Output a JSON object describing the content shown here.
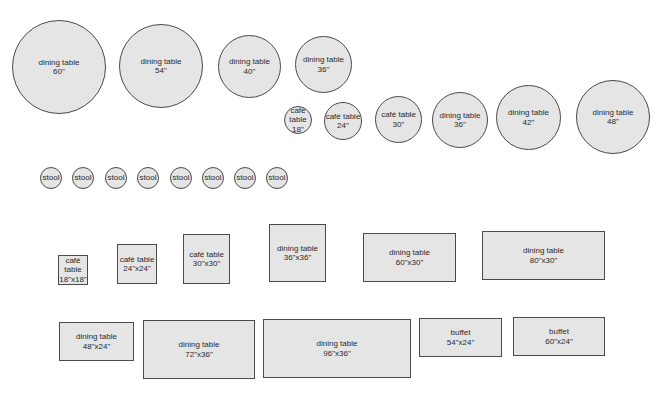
{
  "style": {
    "fill": "#e5e5e5",
    "stroke": "#4a4a4a",
    "text": "#2a2a2a",
    "background": "#ffffff"
  },
  "round_tables": [
    {
      "label": "dining table\n60\"",
      "size": "60\"",
      "x": 12,
      "y": 20,
      "d": 94
    },
    {
      "label": "dining table\n54\"",
      "size": "54\"",
      "x": 119,
      "y": 24,
      "d": 84
    },
    {
      "label": "dining table\n40\"",
      "size": "40\"",
      "x": 218,
      "y": 35,
      "d": 63
    },
    {
      "label": "dining table\n36\"",
      "size": "36\"",
      "x": 295,
      "y": 36,
      "d": 57
    },
    {
      "label": "café\ntable\n18\"",
      "size": "18\"",
      "x": 284,
      "y": 106,
      "d": 28
    },
    {
      "label": "café table\n24\"",
      "size": "24\"",
      "x": 324,
      "y": 102,
      "d": 38
    },
    {
      "label": "café table\n30\"",
      "size": "30\"",
      "x": 375,
      "y": 96,
      "d": 47
    },
    {
      "label": "dining table\n36\"",
      "size": "36\"",
      "x": 432,
      "y": 92,
      "d": 56
    },
    {
      "label": "dining table\n42\"",
      "size": "42\"",
      "x": 496,
      "y": 85,
      "d": 65
    },
    {
      "label": "dining table\n48\"",
      "size": "48\"",
      "x": 576,
      "y": 80,
      "d": 74
    }
  ],
  "stools": [
    {
      "label": "stool",
      "x": 40,
      "y": 167,
      "d": 22
    },
    {
      "label": "stool",
      "x": 72,
      "y": 167,
      "d": 22
    },
    {
      "label": "stool",
      "x": 105,
      "y": 167,
      "d": 22
    },
    {
      "label": "stool",
      "x": 137,
      "y": 167,
      "d": 22
    },
    {
      "label": "stool",
      "x": 170,
      "y": 167,
      "d": 22
    },
    {
      "label": "stool",
      "x": 202,
      "y": 167,
      "d": 22
    },
    {
      "label": "stool",
      "x": 234,
      "y": 167,
      "d": 22
    },
    {
      "label": "stool",
      "x": 266,
      "y": 167,
      "d": 22
    }
  ],
  "rect_tables": [
    {
      "label": "café\ntable\n18\"x18\"",
      "size": "18\"x18\"",
      "x": 58,
      "y": 255,
      "w": 30,
      "h": 30
    },
    {
      "label": "café table\n24\"x24\"",
      "size": "24\"x24\"",
      "x": 117,
      "y": 244,
      "w": 40,
      "h": 40
    },
    {
      "label": "café table\n30\"x30\"",
      "size": "30\"x30\"",
      "x": 183,
      "y": 234,
      "w": 47,
      "h": 50
    },
    {
      "label": "dining table\n36\"x36\"",
      "size": "36\"x36\"",
      "x": 269,
      "y": 224,
      "w": 57,
      "h": 58
    },
    {
      "label": "dining table\n60\"x30\"",
      "size": "60\"x30\"",
      "x": 363,
      "y": 233,
      "w": 93,
      "h": 49
    },
    {
      "label": "dining table\n80\"x30\"",
      "size": "80\"x30\"",
      "x": 482,
      "y": 231,
      "w": 123,
      "h": 49
    },
    {
      "label": "dining table\n48\"x24\"",
      "size": "48\"x24\"",
      "x": 59,
      "y": 322,
      "w": 75,
      "h": 39
    },
    {
      "label": "dining table\n72\"x36\"",
      "size": "72\"x36\"",
      "x": 143,
      "y": 320,
      "w": 112,
      "h": 59
    },
    {
      "label": "dining table\n96\"x36\"",
      "size": "96\"x36\"",
      "x": 263,
      "y": 319,
      "w": 148,
      "h": 59
    },
    {
      "label": "buffet\n54\"x24\"",
      "size": "54\"x24\"",
      "x": 419,
      "y": 318,
      "w": 83,
      "h": 39
    },
    {
      "label": "buffet\n60\"x24\"",
      "size": "60\"x24\"",
      "x": 513,
      "y": 317,
      "w": 92,
      "h": 39
    }
  ]
}
